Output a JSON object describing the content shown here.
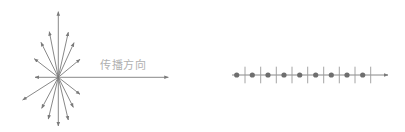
{
  "diagram": {
    "left": {
      "title": "transverse-wave-starburst",
      "label": "传播方向",
      "center": [
        58.3,
        77.3
      ],
      "arrow_color": "#7a7a7a",
      "propagation_arrow": {
        "from": [
          58.3,
          77.3
        ],
        "to": [
          168.3,
          77.3
        ]
      },
      "arrows": [
        [
          58.3,
          11.7
        ],
        [
          58.3,
          126
        ],
        [
          35,
          77.3
        ],
        [
          49.3,
          31.7
        ],
        [
          68.3,
          32.3
        ],
        [
          41,
          42.3
        ],
        [
          74,
          42.7
        ],
        [
          34.3,
          58.7
        ],
        [
          80,
          59.3
        ],
        [
          22.7,
          100
        ],
        [
          80,
          94.3
        ],
        [
          41.7,
          108.3
        ],
        [
          73.3,
          107.3
        ],
        [
          48.3,
          119
        ],
        [
          68.3,
          120
        ]
      ]
    },
    "right": {
      "title": "longitudinal-particle-chain",
      "axis": {
        "from": [
          232,
          75
        ],
        "to": [
          388,
          75
        ],
        "y": 75
      },
      "dots_x": [
        236.7,
        252.3,
        268,
        284,
        299.7,
        315.7,
        331.3,
        347,
        362.7
      ],
      "ticks_x": [
        245,
        260.7,
        276.3,
        292,
        307.7,
        323.7,
        339.3,
        355,
        370.7
      ],
      "tick_span": [
        66.7,
        83.3
      ],
      "dot_color": "#6e6e6e",
      "tick_color": "#9a9a9a"
    }
  }
}
